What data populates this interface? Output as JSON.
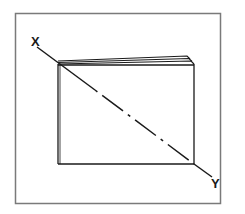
{
  "diagram": {
    "type": "rotation-axis-illustration",
    "labels": {
      "start": "X",
      "end": "Y"
    },
    "colors": {
      "frame": "#7a7a7a",
      "lines": "#1a1a1a",
      "background": "#ffffff"
    }
  }
}
